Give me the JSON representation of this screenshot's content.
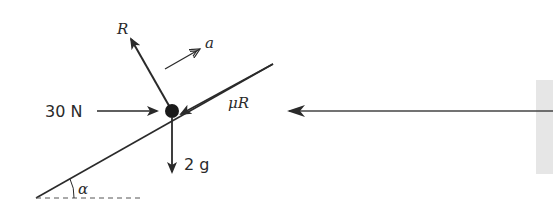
{
  "diagram": {
    "type": "force-diagram-inclined-plane",
    "labels": {
      "normal_reaction": "R",
      "acceleration": "a",
      "applied_force": "30 N",
      "friction": "μR",
      "weight": "2 g",
      "angle": "α"
    },
    "colors": {
      "stroke": "#2a2a2a",
      "particle": "#1a1a1a",
      "panel": "#e6e6e6"
    }
  }
}
